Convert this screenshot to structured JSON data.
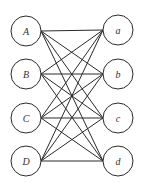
{
  "diagram": {
    "type": "complete-bipartite-graph",
    "stroke_color": "#2a2a2a",
    "left_nodes": [
      {
        "label": "A",
        "cx": 26,
        "cy": 31
      },
      {
        "label": "B",
        "cx": 26,
        "cy": 74
      },
      {
        "label": "C",
        "cx": 26,
        "cy": 118
      },
      {
        "label": "D",
        "cx": 26,
        "cy": 161
      }
    ],
    "right_nodes": [
      {
        "label": "a",
        "cx": 118,
        "cy": 30
      },
      {
        "label": "b",
        "cx": 118,
        "cy": 74
      },
      {
        "label": "c",
        "cx": 118,
        "cy": 118
      },
      {
        "label": "d",
        "cx": 118,
        "cy": 161
      }
    ],
    "radius": 15
  }
}
